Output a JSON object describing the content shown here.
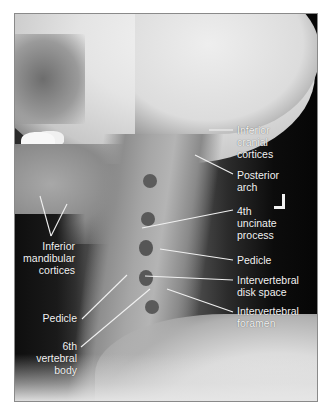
{
  "figure": {
    "orientation_marker": "L",
    "labels_right": [
      {
        "id": "inferior-cranial-cortices",
        "text": "Inferior\ncranial\ncortices"
      },
      {
        "id": "posterior-arch",
        "text": "Posterior\narch"
      },
      {
        "id": "4th-uncinate-process",
        "text": "4th\nuncinate\nprocess"
      },
      {
        "id": "pedicle-right",
        "text": "Pedicle"
      },
      {
        "id": "intervertebral-disk-space",
        "text": "Intervertebral\ndisk space"
      },
      {
        "id": "intervertebral-foramen",
        "text": "Intervertebral\nforamen"
      }
    ],
    "labels_left": [
      {
        "id": "inferior-mandibular-cortices",
        "text": "Inferior\nmandibular\ncortices"
      },
      {
        "id": "pedicle-left",
        "text": "Pedicle"
      },
      {
        "id": "6th-vertebral-body",
        "text": "6th\nvertebral\nbody"
      }
    ],
    "colors": {
      "label_text": "#f2f2f2",
      "leader_line": "#f0f0f0",
      "frame_border": "#8a8a8a",
      "background_dark": "#111111"
    }
  }
}
